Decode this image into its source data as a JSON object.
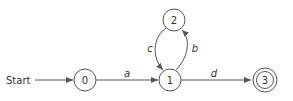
{
  "diagram": {
    "type": "finite-state-automaton",
    "start_label": "Start",
    "states": [
      {
        "id": "0",
        "label": "0",
        "accepting": false,
        "start": true
      },
      {
        "id": "1",
        "label": "1",
        "accepting": false,
        "start": false
      },
      {
        "id": "2",
        "label": "2",
        "accepting": false,
        "start": false
      },
      {
        "id": "3",
        "label": "3",
        "accepting": true,
        "start": false
      }
    ],
    "transitions": [
      {
        "from": "0",
        "to": "1",
        "label": "a"
      },
      {
        "from": "1",
        "to": "2",
        "label": "b"
      },
      {
        "from": "2",
        "to": "1",
        "label": "c"
      },
      {
        "from": "1",
        "to": "3",
        "label": "d"
      }
    ],
    "colors": {
      "stroke": "#555555",
      "text": "#333333",
      "background": "#ffffff"
    }
  }
}
